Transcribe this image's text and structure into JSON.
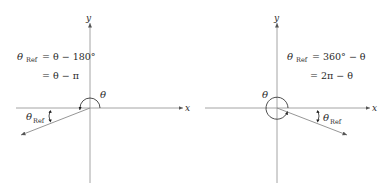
{
  "left_panel": {
    "axis_x_label": "x",
    "axis_y_label": "y",
    "angle_label": "θ",
    "ref_symbol": "θ",
    "ref_subscript": "Ref",
    "formula_line1_lhs_symbol": "θ",
    "formula_line1_lhs_sub": "Ref",
    "formula_line1_rhs": "= θ − 180°",
    "formula_line2": "=  θ − π"
  },
  "right_panel": {
    "axis_x_label": "x",
    "axis_y_label": "y",
    "angle_label": "θ",
    "ref_symbol": "θ",
    "ref_subscript": "Ref",
    "formula_line1_lhs_symbol": "θ",
    "formula_line1_lhs_sub": "Ref",
    "formula_line1_rhs": "= 360° − θ",
    "formula_line2": "= 2π − θ"
  },
  "colors": {
    "axis": "#9a9a9a",
    "ray": "#8a8a8a",
    "text": "#2a2a2a"
  }
}
